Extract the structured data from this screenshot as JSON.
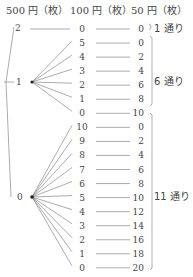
{
  "headers": {
    "yen500": "500 円（枚）",
    "yen100": "100 円（枚）",
    "yen50": "50 円（枚）"
  },
  "groups": [
    {
      "yen500": "2",
      "rows": [
        {
          "yen100": "0",
          "yen50": "0"
        }
      ],
      "count_label": "1 通り"
    },
    {
      "yen500": "1",
      "rows": [
        {
          "yen100": "5",
          "yen50": "0"
        },
        {
          "yen100": "4",
          "yen50": "2"
        },
        {
          "yen100": "3",
          "yen50": "4"
        },
        {
          "yen100": "2",
          "yen50": "6"
        },
        {
          "yen100": "1",
          "yen50": "8"
        },
        {
          "yen100": "0",
          "yen50": "10"
        }
      ],
      "count_label": "6 通り"
    },
    {
      "yen500": "0",
      "rows": [
        {
          "yen100": "10",
          "yen50": "0"
        },
        {
          "yen100": "9",
          "yen50": "2"
        },
        {
          "yen100": "8",
          "yen50": "4"
        },
        {
          "yen100": "7",
          "yen50": "6"
        },
        {
          "yen100": "6",
          "yen50": "8"
        },
        {
          "yen100": "5",
          "yen50": "10"
        },
        {
          "yen100": "4",
          "yen50": "12"
        },
        {
          "yen100": "3",
          "yen50": "14"
        },
        {
          "yen100": "2",
          "yen50": "16"
        },
        {
          "yen100": "1",
          "yen50": "18"
        },
        {
          "yen100": "0",
          "yen50": "20"
        }
      ],
      "count_label": "11 通り"
    }
  ]
}
